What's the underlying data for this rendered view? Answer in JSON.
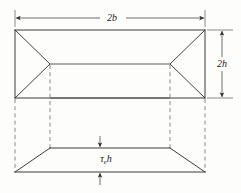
{
  "figure": {
    "labels": {
      "width_label": "2b",
      "height_label": "2h",
      "thickness_symbol": "τ",
      "thickness_subscript": "e",
      "thickness_variable": "h",
      "thickness_label": "τe h"
    },
    "colors": {
      "solid_stroke": "#3a3a3a",
      "dashed_stroke": "#8a8a8a",
      "dimension_stroke": "#4a4a4a",
      "text_fill": "#1a1a1a",
      "background": "#fdfdfc"
    },
    "geometry": {
      "outer_rect": {
        "x": 15,
        "y": 30,
        "width": 190,
        "height": 68
      },
      "inner_rect": {
        "x": 50,
        "y": 64,
        "width": 120,
        "height": 34
      },
      "lower_trapezoid": {
        "top_left": {
          "x": 50,
          "y": 148
        },
        "top_right": {
          "x": 170,
          "y": 148
        },
        "bottom_right": {
          "x": 205,
          "y": 172
        },
        "bottom_left": {
          "x": 15,
          "y": 172
        }
      },
      "dashed_verticals": [
        {
          "x": 15,
          "y_top": 98,
          "y_bottom": 172
        },
        {
          "x": 50,
          "y_top": 64,
          "y_bottom": 148
        },
        {
          "x": 170,
          "y_top": 64,
          "y_bottom": 148
        },
        {
          "x": 205,
          "y_top": 98,
          "y_bottom": 172
        }
      ],
      "width_dimension": {
        "y": 18,
        "x_start": 15,
        "x_end": 205
      },
      "height_dimension": {
        "x": 222,
        "y_start": 30,
        "y_end": 98
      },
      "thickness_dimension": {
        "x": 100,
        "y_top": 140,
        "y_bottom": 182
      }
    }
  }
}
